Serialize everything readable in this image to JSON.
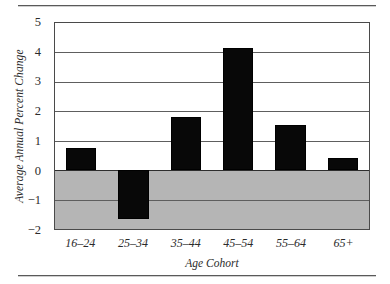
{
  "chart_data": {
    "type": "bar",
    "title": "",
    "xlabel": "Age Cohort",
    "ylabel": "Average Annual Percent Change",
    "categories": [
      "16–24",
      "25–34",
      "35–44",
      "45–54",
      "55–64",
      "65+"
    ],
    "values": [
      0.75,
      -1.65,
      1.8,
      4.15,
      1.55,
      0.4
    ],
    "ylim": [
      -2,
      5
    ],
    "yticks": [
      5,
      4,
      3,
      2,
      1,
      0,
      -1,
      -2
    ],
    "ytick_labels": [
      "5",
      "4",
      "3",
      "2",
      "1",
      "0",
      "−1",
      "−2"
    ],
    "grid": true,
    "legend": false,
    "bar_color": "#080808",
    "negative_band_color": "#b5b5b5",
    "gridline_color": "#5e5e5e",
    "zero_line_color": "#2e2e2e",
    "frame_color": "#4a4a4a",
    "background_color": "#ffffff"
  },
  "figure": {
    "rule_color": "#5a5a5a"
  }
}
